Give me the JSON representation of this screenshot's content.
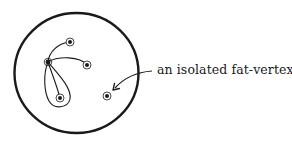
{
  "diagram": {
    "annotation": "an isolated fat-vertex",
    "colors": {
      "stroke": "#1a1a1a",
      "background": "#ffffff"
    },
    "boundary": {
      "shape": "circle",
      "cx": 76.5,
      "cy": 73,
      "rx": 62,
      "ry": 60
    },
    "vertices": [
      {
        "id": "hub",
        "x": 48,
        "y": 62,
        "role": "hub"
      },
      {
        "id": "top",
        "x": 70,
        "y": 42
      },
      {
        "id": "right",
        "x": 87,
        "y": 65
      },
      {
        "id": "bottom",
        "x": 60,
        "y": 98
      },
      {
        "id": "isolated",
        "x": 107,
        "y": 96,
        "role": "isolated"
      }
    ],
    "edges": [
      {
        "from": "hub",
        "to": "top"
      },
      {
        "from": "hub",
        "to": "right"
      },
      {
        "from": "hub",
        "to": "bottom"
      },
      {
        "from": "hub",
        "to": "hub",
        "type": "loop-around-bottom"
      }
    ],
    "arrow": {
      "from_label": true,
      "points_to": "isolated"
    }
  }
}
